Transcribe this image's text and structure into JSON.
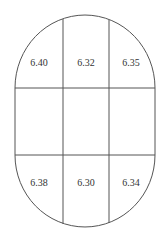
{
  "diagram": {
    "shape": "stadium (rounded oval) divided into 3x3 grid",
    "line_color": "#555555",
    "top_row": [
      {
        "position": "top-left",
        "value": "6.40"
      },
      {
        "position": "top-center",
        "value": "6.32"
      },
      {
        "position": "top-right",
        "value": "6.35"
      }
    ],
    "middle_row": [
      {
        "position": "middle-left",
        "value": ""
      },
      {
        "position": "middle-center",
        "value": ""
      },
      {
        "position": "middle-right",
        "value": ""
      }
    ],
    "bottom_row": [
      {
        "position": "bottom-left",
        "value": "6.38"
      },
      {
        "position": "bottom-center",
        "value": "6.30"
      },
      {
        "position": "bottom-right",
        "value": "6.34"
      }
    ]
  }
}
